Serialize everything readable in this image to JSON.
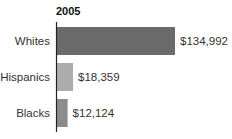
{
  "chart_data": {
    "type": "bar",
    "orientation": "horizontal",
    "title": "2005",
    "xlabel": "",
    "ylabel": "",
    "categories": [
      "Whites",
      "Hispanics",
      "Blacks"
    ],
    "values": [
      134992,
      18359,
      12124
    ],
    "value_labels": [
      "$134,992",
      "$18,359",
      "$12,124"
    ],
    "colors": [
      "#6b6b6b",
      "#acacac",
      "#8c8c8c"
    ],
    "xlim": [
      0,
      134992
    ],
    "grid": false,
    "legend": "none"
  }
}
